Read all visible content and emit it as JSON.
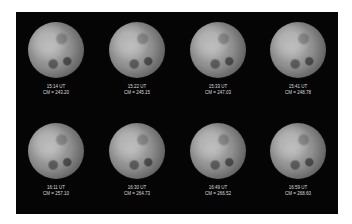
{
  "frames": [
    {
      "time": "15:14 UT",
      "cm": "CM = 243.20"
    },
    {
      "time": "15:22 UT",
      "cm": "CM = 245.15"
    },
    {
      "time": "15:33 UT",
      "cm": "CM = 247.03"
    },
    {
      "time": "15:41 UT",
      "cm": "CM = 248.78"
    },
    {
      "time": "16:11 UT",
      "cm": "CM = 257.10"
    },
    {
      "time": "16:30 UT",
      "cm": "CM = 264.73"
    },
    {
      "time": "16:49 UT",
      "cm": "CM = 266.52"
    },
    {
      "time": "16:59 UT",
      "cm": "CM = 268.60"
    }
  ],
  "colors": {
    "background": "#050505",
    "label": "#dcdcdc"
  }
}
